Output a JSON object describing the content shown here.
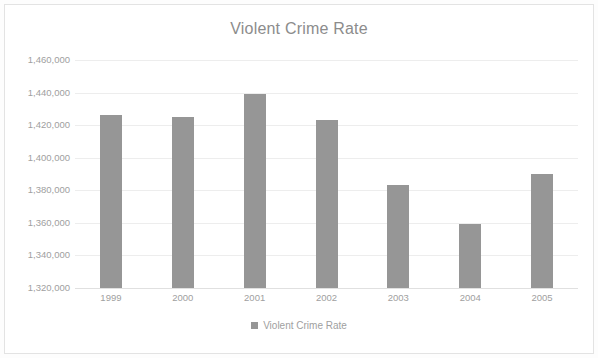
{
  "chart_data": {
    "type": "bar",
    "title": "Violent Crime Rate",
    "xlabel": "",
    "ylabel": "",
    "categories": [
      "1999",
      "2000",
      "2001",
      "2002",
      "2003",
      "2004",
      "2005"
    ],
    "values": [
      1426000,
      1425000,
      1439000,
      1423000,
      1383500,
      1359500,
      1390000
    ],
    "series": [
      {
        "name": "Violent Crime Rate",
        "values": [
          1426000,
          1425000,
          1439000,
          1423000,
          1383500,
          1359500,
          1390000
        ]
      }
    ],
    "ylim": [
      1320000,
      1460000
    ],
    "ytick_step": 20000,
    "ytick_labels": [
      "1,460,000",
      "1,440,000",
      "1,420,000",
      "1,400,000",
      "1,380,000",
      "1,360,000",
      "1,340,000",
      "1,320,000"
    ],
    "ytick_values": [
      1460000,
      1440000,
      1420000,
      1400000,
      1380000,
      1360000,
      1340000,
      1320000
    ],
    "grid": true,
    "grid_axis": "y",
    "legend": {
      "position": "bottom",
      "entries": [
        {
          "label": "Violent Crime Rate",
          "color": "#969696",
          "marker": "square"
        }
      ]
    },
    "bar_color": "#969696",
    "background_color": "#ffffff",
    "text_color": "#a0a0a0",
    "title_color": "#8c8c8c",
    "gridline_color": "#ededed"
  }
}
